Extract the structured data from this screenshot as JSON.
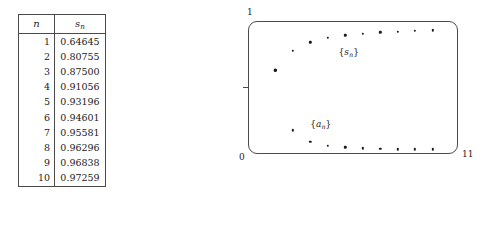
{
  "table": {
    "headers": [
      "n",
      "s_n"
    ],
    "header_display": {
      "col1": "n",
      "col2_base": "s",
      "col2_sub": "n"
    },
    "rows": [
      {
        "n": "1",
        "s": "0.64645"
      },
      {
        "n": "2",
        "s": "0.80755"
      },
      {
        "n": "3",
        "s": "0.87500"
      },
      {
        "n": "4",
        "s": "0.91056"
      },
      {
        "n": "5",
        "s": "0.93196"
      },
      {
        "n": "6",
        "s": "0.94601"
      },
      {
        "n": "7",
        "s": "0.95581"
      },
      {
        "n": "8",
        "s": "0.96296"
      },
      {
        "n": "9",
        "s": "0.96838"
      },
      {
        "n": "10",
        "s": "0.97259"
      }
    ]
  },
  "plot": {
    "axis_labels": {
      "ymax": "1",
      "origin": "0",
      "xmax": "11"
    },
    "series_labels": {
      "sn_base": "s",
      "sn_sub": "n",
      "an_base": "a",
      "an_sub": "n"
    },
    "point_color": "#1a1a1a",
    "frame_color": "#4a4a4a"
  },
  "chart_data": {
    "type": "scatter",
    "title": "",
    "xlabel": "",
    "ylabel": "",
    "xlim": [
      0,
      11
    ],
    "ylim": [
      0,
      1
    ],
    "grid": false,
    "legend": "inline-annotations",
    "xticks": [
      "0",
      "11"
    ],
    "yticks": [
      "0",
      "1"
    ],
    "x": [
      1,
      2,
      3,
      4,
      5,
      6,
      7,
      8,
      9,
      10
    ],
    "series": [
      {
        "name": "{s_n}",
        "label_position": [
          5.2,
          0.79
        ],
        "values": [
          0.64645,
          0.80755,
          0.875,
          0.91056,
          0.93196,
          0.94601,
          0.95581,
          0.96296,
          0.96838,
          0.97259
        ]
      },
      {
        "name": "{a_n}",
        "label_position": [
          3.6,
          0.2
        ],
        "values": [
          0.64645,
          0.1611,
          0.06745,
          0.03556,
          0.0214,
          0.01405,
          0.0098,
          0.00715,
          0.00542,
          0.00421
        ]
      }
    ]
  }
}
